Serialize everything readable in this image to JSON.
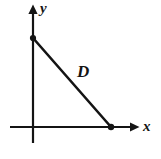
{
  "figure": {
    "type": "geometry-diagram",
    "background_color": "#ffffff",
    "stroke_color": "#141414",
    "labels": {
      "y_axis": "y",
      "x_axis": "x",
      "hypotenuse": "D"
    },
    "axes": {
      "x_axis": {
        "name": "x-axis",
        "start": [
          10,
          127
        ],
        "end": [
          139,
          127
        ],
        "arrow": "right",
        "label": "x"
      },
      "y_axis": {
        "name": "y-axis",
        "start": [
          33,
          143
        ],
        "end": [
          33,
          5
        ],
        "arrow": "up",
        "label": "y"
      }
    },
    "vertices": [
      {
        "name": "y-intercept-point",
        "x": 33,
        "y": 38,
        "marker": "filled-dot"
      },
      {
        "name": "x-intercept-point",
        "x": 111,
        "y": 127,
        "marker": "filled-dot"
      }
    ],
    "segments": [
      {
        "name": "hypotenuse",
        "label": "D",
        "from": [
          33,
          38
        ],
        "to": [
          111,
          127
        ]
      }
    ]
  }
}
